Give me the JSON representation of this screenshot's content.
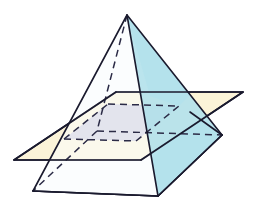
{
  "figure": {
    "title": "Square pyramid intersected by two parallel planes",
    "canvas": {
      "width": 262,
      "height": 214,
      "background": "#ffffff"
    },
    "colors": {
      "outline": "#1a1a2e",
      "pyramid_left_face": "#fbfdfe",
      "pyramid_right_face": "#b4e2ec",
      "pyramid_base_front": "#eef8fb",
      "cross_section": "#c6c6da",
      "upper_plane": "#fbf3d8",
      "lower_plane": "#ddf1f8",
      "lower_plane_tab": "#b4e2ec",
      "dashed_line": "#2b2b46",
      "background": "#ffffff"
    },
    "stroke": {
      "solid_width": 1.6,
      "dashed_width": 1.5,
      "dash_pattern": "7,5"
    },
    "objects": [
      {
        "name": "square-pyramid",
        "kind": "solid",
        "vertices": {
          "apex": [
            127,
            15
          ],
          "base_front": [
            158,
            196
          ],
          "base_left": [
            33,
            191
          ],
          "base_right": [
            222,
            135
          ],
          "base_back": [
            97,
            131
          ]
        },
        "visible_faces": [
          "left-face",
          "right-face"
        ],
        "hidden_edges": [
          "apex-to-back-vertex",
          "back-vertex-to-left",
          "back-vertex-to-right"
        ]
      },
      {
        "name": "upper-cutting-plane",
        "kind": "plane",
        "fill": "#fbf3d8",
        "corners": [
          [
            14,
            160
          ],
          [
            116,
            92
          ],
          [
            243,
            92
          ],
          [
            141,
            160
          ]
        ]
      },
      {
        "name": "lower-cutting-plane",
        "kind": "plane",
        "fill": "#ddf1f8",
        "corners": [
          [
            33,
            191
          ],
          [
            97,
            131
          ],
          [
            222,
            135
          ],
          [
            158,
            196
          ]
        ]
      },
      {
        "name": "cross-section-quadrilateral",
        "kind": "intersection",
        "fill": "#c6c6da",
        "corners": [
          [
            64,
            139
          ],
          [
            108,
            104
          ],
          [
            179,
            106
          ],
          [
            136,
            141
          ]
        ]
      }
    ],
    "labels": []
  }
}
